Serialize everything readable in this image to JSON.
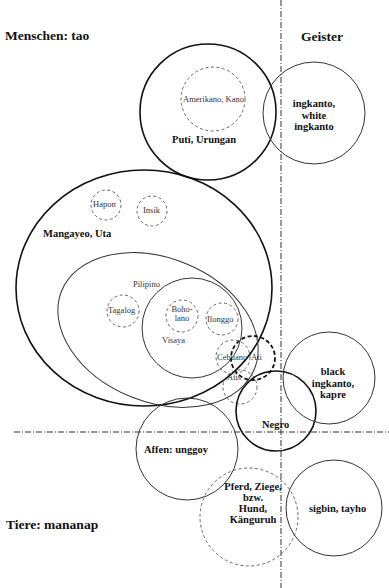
{
  "diagram": {
    "region_labels": {
      "humans": "Menschen: tao",
      "spirits": "Geister",
      "animals": "Tiere: mananap"
    },
    "groups": {
      "puti": "Putí, Urungan",
      "amerikano": "Amerikano, Kano",
      "ingkanto": "ingkanto,\nwhite ingkanto",
      "mangayeo": "Mangayeo, Uta",
      "hapon": "Hapon",
      "insik": "Insik",
      "pilipino": "Pilipino",
      "tagalog": "Tagalog",
      "boholano": "Boho-\nlano",
      "ilonggo": "Ilonggo",
      "visaya": "Visaya",
      "cebuano": "Cebuano",
      "ati": "Ati",
      "atis": "Atis",
      "negro": "Negro",
      "black_ingkanto": "black ingkanto,\nkapre",
      "affen": "Affen: unggoy",
      "pferd": "Pferd, Ziege,\nbzw.\nHund,\nKänguruh",
      "sigbin": "sigbin, tayho"
    },
    "colors": {
      "line": "#111111",
      "dashed": "#555555",
      "background": "#ffffff"
    }
  }
}
